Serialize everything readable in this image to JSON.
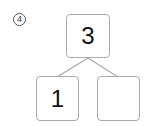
{
  "problem": {
    "number_label": "4",
    "number_bond": {
      "whole": "3",
      "parts": [
        "1",
        ""
      ]
    }
  }
}
